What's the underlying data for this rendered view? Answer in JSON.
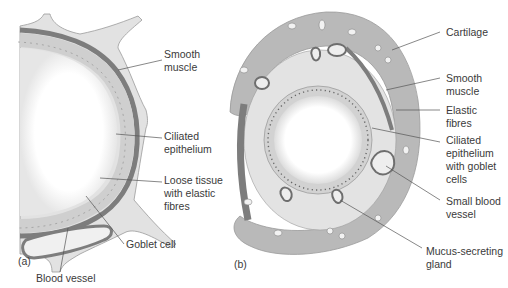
{
  "colors": {
    "background": "#ffffff",
    "cartilage": "#b9b9b9",
    "cartilage_outline": "#9a9a9a",
    "loose_tissue": "#e3e3e3",
    "smooth_muscle": "#7d7d7d",
    "epithelium": "#cfcfcf",
    "lumen": "#ffffff",
    "label_text": "#3a3a3a",
    "leader_line": "#555555"
  },
  "panel_a": {
    "id": "(a)",
    "labels": [
      {
        "name": "smooth-muscle",
        "lines": [
          "Smooth",
          "muscle"
        ]
      },
      {
        "name": "ciliated-epithelium",
        "lines": [
          "Ciliated",
          "epithelium"
        ]
      },
      {
        "name": "loose-tissue",
        "lines": [
          "Loose tissue",
          "with elastic",
          "fibres"
        ]
      },
      {
        "name": "goblet-cell",
        "lines": [
          "Goblet cell"
        ]
      },
      {
        "name": "blood-vessel",
        "lines": [
          "Blood vessel"
        ]
      }
    ]
  },
  "panel_b": {
    "id": "(b)",
    "labels": [
      {
        "name": "cartilage",
        "lines": [
          "Cartilage"
        ]
      },
      {
        "name": "smooth-muscle",
        "lines": [
          "Smooth",
          "muscle"
        ]
      },
      {
        "name": "elastic-fibres",
        "lines": [
          "Elastic",
          "fibres"
        ]
      },
      {
        "name": "ciliated-epithelium-goblet",
        "lines": [
          "Ciliated",
          "epithelium",
          "with goblet",
          "cells"
        ]
      },
      {
        "name": "small-blood-vessel",
        "lines": [
          "Small blood",
          "vessel"
        ]
      },
      {
        "name": "mucus-gland",
        "lines": [
          "Mucus-secreting",
          "gland"
        ]
      }
    ]
  }
}
